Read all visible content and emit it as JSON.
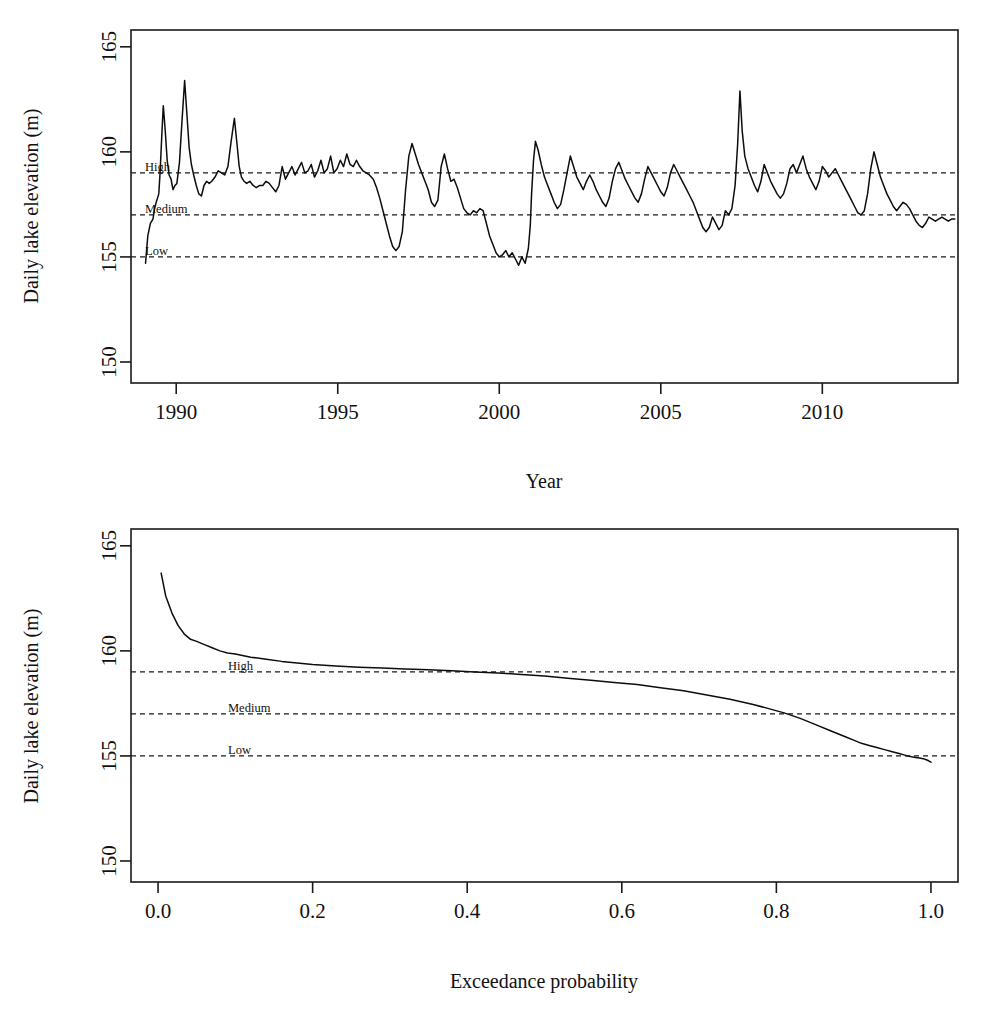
{
  "figure": {
    "panels": [
      {
        "id": "timeseries",
        "ylabel": "Daily lake elevation (m)",
        "xlabel": "Year",
        "ytick_labels": [
          "165",
          "160",
          "155",
          "150"
        ],
        "xtick_labels": [
          "1990",
          "1995",
          "2000",
          "2005",
          "2010"
        ]
      },
      {
        "id": "exceedance",
        "ylabel": "Daily lake elevation (m)",
        "xlabel": "Exceedance probability",
        "ytick_labels": [
          "165",
          "160",
          "155",
          "150"
        ],
        "xtick_labels": [
          "0.0",
          "0.2",
          "0.4",
          "0.6",
          "0.8",
          "1.0"
        ]
      }
    ],
    "thresholds": [
      {
        "label": "High",
        "value": 159
      },
      {
        "label": "Medium",
        "value": 157
      },
      {
        "label": "Low",
        "value": 155
      }
    ],
    "colors": {
      "line": "#0d0d0d",
      "frame": "#1a1a1a",
      "threshold": "#1a1a1a",
      "background": "#ffffff"
    }
  },
  "chart_data": [
    {
      "type": "line",
      "id": "timeseries",
      "title": "",
      "xlabel": "Year",
      "ylabel": "Daily lake elevation (m)",
      "xlim": [
        1988.6,
        2014.2
      ],
      "ylim": [
        149.0,
        165.8
      ],
      "yticks": [
        150,
        155,
        160,
        165
      ],
      "xticks": [
        1990,
        1995,
        2000,
        2005,
        2010
      ],
      "grid": false,
      "legend": "none",
      "annotations": [
        {
          "text": "High",
          "y": 159
        },
        {
          "text": "Medium",
          "y": 157
        },
        {
          "text": "Low",
          "y": 155
        }
      ],
      "hlines": [
        159,
        157,
        155
      ],
      "x": [
        1989.05,
        1989.12,
        1989.2,
        1989.28,
        1989.33,
        1989.38,
        1989.42,
        1989.46,
        1989.5,
        1989.56,
        1989.6,
        1989.66,
        1989.72,
        1989.78,
        1989.84,
        1989.9,
        1989.96,
        1990.02,
        1990.1,
        1990.18,
        1990.26,
        1990.33,
        1990.4,
        1990.47,
        1990.54,
        1990.62,
        1990.7,
        1990.78,
        1990.86,
        1990.94,
        1991.02,
        1991.1,
        1991.2,
        1991.3,
        1991.4,
        1991.5,
        1991.6,
        1991.7,
        1991.8,
        1991.88,
        1991.95,
        1992.02,
        1992.1,
        1992.18,
        1992.28,
        1992.38,
        1992.48,
        1992.58,
        1992.68,
        1992.78,
        1992.88,
        1992.98,
        1993.08,
        1993.18,
        1993.28,
        1993.38,
        1993.48,
        1993.58,
        1993.68,
        1993.78,
        1993.88,
        1993.98,
        1994.08,
        1994.18,
        1994.28,
        1994.38,
        1994.48,
        1994.58,
        1994.68,
        1994.78,
        1994.88,
        1994.98,
        1995.08,
        1995.18,
        1995.28,
        1995.38,
        1995.48,
        1995.58,
        1995.68,
        1995.78,
        1995.88,
        1995.98,
        1996.1,
        1996.2,
        1996.3,
        1996.4,
        1996.5,
        1996.6,
        1996.7,
        1996.8,
        1996.9,
        1997.0,
        1997.1,
        1997.2,
        1997.3,
        1997.4,
        1997.5,
        1997.6,
        1997.7,
        1997.8,
        1997.9,
        1998.0,
        1998.1,
        1998.2,
        1998.3,
        1998.4,
        1998.5,
        1998.6,
        1998.7,
        1998.8,
        1998.9,
        1999.0,
        1999.1,
        1999.2,
        1999.3,
        1999.4,
        1999.5,
        1999.6,
        1999.7,
        1999.8,
        1999.9,
        2000.0,
        2000.1,
        2000.2,
        2000.3,
        2000.4,
        2000.5,
        2000.6,
        2000.7,
        2000.8,
        2000.9,
        2000.96,
        2001.0,
        2001.06,
        2001.12,
        2001.2,
        2001.3,
        2001.4,
        2001.5,
        2001.6,
        2001.7,
        2001.8,
        2001.9,
        2002.0,
        2002.1,
        2002.2,
        2002.3,
        2002.4,
        2002.5,
        2002.6,
        2002.7,
        2002.8,
        2002.9,
        2003.0,
        2003.1,
        2003.2,
        2003.3,
        2003.4,
        2003.5,
        2003.6,
        2003.7,
        2003.8,
        2003.9,
        2004.0,
        2004.1,
        2004.2,
        2004.3,
        2004.4,
        2004.5,
        2004.6,
        2004.7,
        2004.8,
        2004.9,
        2005.0,
        2005.1,
        2005.2,
        2005.3,
        2005.4,
        2005.5,
        2005.6,
        2005.7,
        2005.8,
        2005.9,
        2006.0,
        2006.1,
        2006.2,
        2006.3,
        2006.4,
        2006.5,
        2006.6,
        2006.7,
        2006.8,
        2006.9,
        2007.0,
        2007.1,
        2007.2,
        2007.3,
        2007.38,
        2007.45,
        2007.52,
        2007.6,
        2007.7,
        2007.8,
        2007.9,
        2008.0,
        2008.1,
        2008.2,
        2008.3,
        2008.4,
        2008.5,
        2008.6,
        2008.7,
        2008.8,
        2008.9,
        2009.0,
        2009.1,
        2009.2,
        2009.3,
        2009.4,
        2009.5,
        2009.6,
        2009.7,
        2009.8,
        2009.9,
        2010.0,
        2010.1,
        2010.2,
        2010.3,
        2010.4,
        2010.5,
        2010.6,
        2010.7,
        2010.8,
        2010.9,
        2011.0,
        2011.1,
        2011.2,
        2011.3,
        2011.4,
        2011.5,
        2011.6,
        2011.7,
        2011.8,
        2011.9,
        2012.0,
        2012.1,
        2012.2,
        2012.3,
        2012.4,
        2012.5,
        2012.6,
        2012.7,
        2012.8,
        2012.9,
        2013.0,
        2013.1,
        2013.2,
        2013.3,
        2013.4,
        2013.5,
        2013.6,
        2013.7,
        2013.8,
        2013.9,
        2014.0,
        2014.1
      ],
      "y": [
        154.7,
        156.0,
        156.6,
        156.8,
        157.3,
        157.6,
        157.8,
        158.0,
        159.0,
        161.0,
        162.2,
        161.0,
        159.6,
        158.9,
        158.7,
        158.2,
        158.4,
        158.5,
        159.5,
        161.5,
        163.4,
        161.8,
        160.2,
        159.4,
        158.9,
        158.4,
        158.0,
        157.9,
        158.4,
        158.6,
        158.5,
        158.6,
        158.8,
        159.1,
        159.0,
        158.9,
        159.3,
        160.5,
        161.6,
        160.4,
        159.3,
        158.8,
        158.6,
        158.5,
        158.6,
        158.4,
        158.3,
        158.4,
        158.4,
        158.6,
        158.5,
        158.3,
        158.1,
        158.4,
        159.3,
        158.7,
        159.0,
        159.3,
        158.9,
        159.2,
        159.5,
        159.0,
        159.1,
        159.4,
        158.8,
        159.1,
        159.6,
        159.0,
        159.2,
        159.8,
        159.0,
        159.2,
        159.6,
        159.3,
        159.9,
        159.4,
        159.3,
        159.6,
        159.3,
        159.1,
        159.0,
        158.9,
        158.7,
        158.3,
        157.8,
        157.2,
        156.6,
        156.0,
        155.5,
        155.3,
        155.5,
        156.2,
        158.2,
        159.8,
        160.4,
        159.9,
        159.4,
        159.0,
        158.6,
        158.2,
        157.6,
        157.4,
        157.7,
        159.3,
        159.9,
        159.2,
        158.6,
        158.7,
        158.3,
        157.8,
        157.3,
        157.1,
        157.0,
        157.2,
        157.1,
        157.3,
        157.2,
        156.6,
        156.0,
        155.6,
        155.2,
        155.0,
        155.1,
        155.3,
        155.0,
        155.2,
        154.9,
        154.6,
        155.0,
        154.7,
        155.4,
        156.5,
        158.0,
        159.6,
        160.5,
        160.1,
        159.4,
        158.8,
        158.4,
        158.0,
        157.6,
        157.3,
        157.5,
        158.2,
        159.0,
        159.8,
        159.3,
        158.8,
        158.5,
        158.2,
        158.6,
        158.9,
        158.6,
        158.2,
        157.9,
        157.6,
        157.4,
        157.8,
        158.6,
        159.2,
        159.5,
        159.1,
        158.7,
        158.4,
        158.1,
        157.8,
        157.6,
        158.0,
        158.7,
        159.3,
        159.0,
        158.7,
        158.4,
        158.1,
        157.9,
        158.3,
        159.0,
        159.4,
        159.1,
        158.8,
        158.5,
        158.2,
        157.9,
        157.6,
        157.2,
        156.8,
        156.4,
        156.2,
        156.4,
        156.9,
        156.6,
        156.3,
        156.5,
        157.2,
        157.0,
        157.3,
        158.4,
        160.4,
        162.9,
        161.0,
        159.8,
        159.2,
        158.8,
        158.4,
        158.1,
        158.6,
        159.4,
        159.0,
        158.6,
        158.3,
        158.0,
        157.8,
        158.0,
        158.5,
        159.2,
        159.4,
        159.0,
        159.4,
        159.8,
        159.2,
        158.8,
        158.5,
        158.2,
        158.6,
        159.3,
        159.1,
        158.8,
        159.0,
        159.2,
        158.9,
        158.6,
        158.3,
        158.0,
        157.7,
        157.4,
        157.1,
        157.0,
        157.2,
        158.0,
        159.2,
        160.0,
        159.4,
        158.8,
        158.4,
        158.0,
        157.7,
        157.4,
        157.2,
        157.4,
        157.6,
        157.5,
        157.3,
        157.0,
        156.7,
        156.5,
        156.4,
        156.6,
        156.9,
        156.8,
        156.7,
        156.8,
        156.9,
        156.8,
        156.7,
        156.8,
        156.8
      ]
    },
    {
      "type": "line",
      "id": "exceedance",
      "title": "",
      "xlabel": "Exceedance probability",
      "ylabel": "Daily lake elevation (m)",
      "xlim": [
        -0.035,
        1.035
      ],
      "ylim": [
        149.0,
        165.8
      ],
      "yticks": [
        150,
        155,
        160,
        165
      ],
      "xticks": [
        0.0,
        0.2,
        0.4,
        0.6,
        0.8,
        1.0
      ],
      "grid": false,
      "legend": "none",
      "annotations": [
        {
          "text": "High",
          "y": 159
        },
        {
          "text": "Medium",
          "y": 157
        },
        {
          "text": "Low",
          "y": 155
        }
      ],
      "hlines": [
        159,
        157,
        155
      ],
      "x": [
        0.004,
        0.01,
        0.018,
        0.026,
        0.034,
        0.042,
        0.05,
        0.06,
        0.07,
        0.08,
        0.09,
        0.1,
        0.12,
        0.14,
        0.16,
        0.18,
        0.2,
        0.23,
        0.26,
        0.29,
        0.32,
        0.35,
        0.38,
        0.41,
        0.44,
        0.47,
        0.5,
        0.53,
        0.56,
        0.59,
        0.62,
        0.65,
        0.68,
        0.71,
        0.74,
        0.77,
        0.79,
        0.81,
        0.83,
        0.85,
        0.87,
        0.89,
        0.9,
        0.91,
        0.92,
        0.93,
        0.94,
        0.95,
        0.96,
        0.965,
        0.97,
        0.975,
        0.98,
        0.985,
        0.99,
        0.994,
        0.997,
        1.0
      ],
      "y": [
        163.7,
        162.6,
        161.8,
        161.2,
        160.8,
        160.55,
        160.45,
        160.3,
        160.15,
        160.0,
        159.9,
        159.85,
        159.7,
        159.6,
        159.5,
        159.42,
        159.35,
        159.28,
        159.22,
        159.18,
        159.14,
        159.1,
        159.05,
        159.0,
        158.95,
        158.88,
        158.8,
        158.7,
        158.6,
        158.5,
        158.4,
        158.25,
        158.1,
        157.9,
        157.7,
        157.45,
        157.25,
        157.05,
        156.8,
        156.5,
        156.2,
        155.9,
        155.75,
        155.6,
        155.5,
        155.4,
        155.3,
        155.2,
        155.1,
        155.05,
        155.0,
        154.96,
        154.93,
        154.9,
        154.87,
        154.82,
        154.77,
        154.7
      ]
    }
  ]
}
